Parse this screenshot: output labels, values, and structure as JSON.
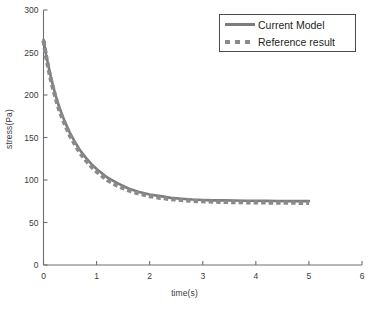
{
  "chart_data": {
    "type": "line",
    "title": "",
    "xlabel": "time(s)",
    "ylabel": "stress(Pa)",
    "xlim": [
      0,
      6
    ],
    "ylim": [
      0,
      300
    ],
    "xticks": [
      0,
      1,
      2,
      3,
      4,
      5,
      6
    ],
    "yticks": [
      0,
      50,
      100,
      150,
      200,
      250,
      300
    ],
    "xtick_labels": [
      "0",
      "1",
      "2",
      "3",
      "4",
      "5",
      "6"
    ],
    "ytick_labels": [
      "0",
      "50",
      "100",
      "150",
      "200",
      "250",
      "300"
    ],
    "grid": false,
    "legend_position": "top-right",
    "series": [
      {
        "name": "Current Model",
        "style": "solid",
        "color": "#7c7c7c",
        "x": [
          0,
          0.05,
          0.1,
          0.15,
          0.2,
          0.25,
          0.3,
          0.4,
          0.5,
          0.6,
          0.7,
          0.8,
          0.9,
          1.0,
          1.2,
          1.4,
          1.6,
          1.8,
          2.0,
          2.2,
          2.4,
          2.6,
          2.8,
          3.0,
          3.2,
          3.4,
          3.6,
          3.8,
          4.0,
          4.2,
          4.4,
          4.6,
          4.8,
          5.0
        ],
        "y": [
          265,
          247,
          232,
          218,
          206,
          195,
          185,
          169,
          155,
          144,
          134,
          126,
          119,
          113,
          103,
          96,
          90,
          86,
          83,
          81,
          79,
          78,
          77,
          76.5,
          76,
          76,
          75.8,
          75.6,
          75.5,
          75.4,
          75.3,
          75.2,
          75.2,
          75.1
        ]
      },
      {
        "name": "Reference result",
        "style": "dashed",
        "color": "#8a8a8a",
        "x": [
          0,
          0.05,
          0.1,
          0.15,
          0.2,
          0.25,
          0.3,
          0.4,
          0.5,
          0.6,
          0.7,
          0.8,
          0.9,
          1.0,
          1.2,
          1.4,
          1.6,
          1.8,
          2.0,
          2.2,
          2.4,
          2.6,
          2.8,
          3.0,
          3.2,
          3.4,
          3.6,
          3.8,
          4.0,
          4.2,
          4.4,
          4.6,
          4.8,
          5.0
        ],
        "y": [
          264,
          245,
          229,
          215,
          203,
          192,
          182,
          166,
          152,
          141,
          131,
          123,
          116,
          110,
          100,
          93,
          88,
          84,
          81,
          79,
          77.5,
          76.5,
          75.5,
          75,
          74.5,
          74.2,
          74,
          73.8,
          73.6,
          73.5,
          73.4,
          73.3,
          73.2,
          73.2
        ]
      }
    ]
  },
  "legend": {
    "items": [
      {
        "label": "Current Model",
        "style": "solid"
      },
      {
        "label": "Reference result",
        "style": "dashed"
      }
    ]
  },
  "colors": {
    "curve": "#7c7c7c",
    "reference": "#8a8a8a",
    "axis": "#6f6f6f",
    "text": "#231f20",
    "background": "#ffffff"
  }
}
